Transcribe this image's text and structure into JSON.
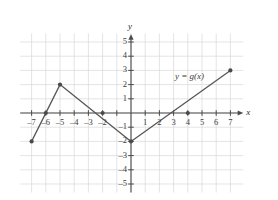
{
  "chart_data": {
    "type": "line",
    "title": "",
    "xlabel": "x",
    "ylabel": "y",
    "curve_label": "y = g(x)",
    "grid": true,
    "legend_position": "inline-annotation",
    "xlim": [
      -7.8,
      7.9
    ],
    "ylim": [
      -5.6,
      5.6
    ],
    "xticks": [
      -7,
      -6,
      -5,
      -4,
      -3,
      -2,
      -1,
      1,
      2,
      3,
      4,
      5,
      6,
      7
    ],
    "yticks": [
      -5,
      -4,
      -3,
      -2,
      -1,
      1,
      2,
      3,
      4,
      5
    ],
    "xtick_labels": [
      "–7",
      "–6",
      "–5",
      "–4",
      "–3",
      "–2",
      "",
      "1",
      "2",
      "3",
      "4",
      "5",
      "6",
      "7"
    ],
    "ytick_labels": [
      "–5",
      "–4",
      "–3",
      "–2",
      "–1",
      "1",
      "2",
      "3",
      "4",
      "5"
    ],
    "series": [
      {
        "name": "g(x)",
        "x": [
          -7,
          -5,
          0,
          7
        ],
        "y": [
          -2,
          2,
          -2,
          3
        ],
        "vertices": [
          {
            "x": -7,
            "y": -2,
            "marker": true
          },
          {
            "x": -5,
            "y": 2,
            "marker": true
          },
          {
            "x": 0,
            "y": -2,
            "marker": true
          },
          {
            "x": 7,
            "y": 3,
            "marker": true
          }
        ],
        "x_intercepts": [
          {
            "x": -6,
            "y": 0,
            "marker": true
          },
          {
            "x": -2,
            "y": 0,
            "marker": true
          },
          {
            "x": 4,
            "y": 0,
            "marker": true
          }
        ],
        "color": "#555555"
      }
    ]
  },
  "style": {
    "curve_color": "#555555",
    "axis_color": "#4a4a4a",
    "grid_color": "#d8d8d8",
    "marker_color": "#4a4a4a",
    "background": "#ffffff"
  }
}
